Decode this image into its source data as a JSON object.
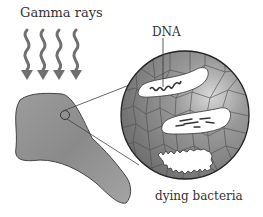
{
  "diagram": {
    "labels": {
      "gamma_rays": "Gamma rays",
      "dna": "DNA",
      "dying_bacteria": "dying bacteria"
    },
    "elements": {
      "rays": {
        "count": 4,
        "color": "#6e6e6e"
      },
      "food_item": {
        "color": "#8a8a8a"
      },
      "magnified_view": {
        "color": "#7a7a7a",
        "border": "#2a2a2a"
      },
      "bacteria": [
        {
          "state": "intact-with-dna"
        },
        {
          "state": "damaged-dna"
        },
        {
          "state": "dying"
        }
      ]
    }
  }
}
